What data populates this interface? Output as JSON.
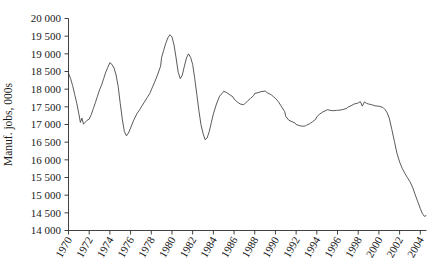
{
  "chart_data": {
    "type": "line",
    "title": "",
    "subtitle": "",
    "xlabel": "",
    "ylabel": "Manuf. jobs, 000s",
    "xlim": [
      1970.0,
      2004.6
    ],
    "ylim": [
      14000,
      20000
    ],
    "ytick_step": 500,
    "grid": false,
    "legend": false,
    "legend_position": "none",
    "line_color": "#3c3c3c",
    "ytick_labels": [
      "20 000",
      "19 500",
      "19 000",
      "18 500",
      "18 000",
      "17 500",
      "17 000",
      "16 500",
      "16 000",
      "15 500",
      "15 000",
      "14 500",
      "14 000"
    ],
    "ytick_values": [
      20000,
      19500,
      19000,
      18500,
      18000,
      17500,
      17000,
      16500,
      16000,
      15500,
      15000,
      14500,
      14000
    ],
    "xtick_labels": [
      "1970",
      "1972",
      "1974",
      "1976",
      "1978",
      "1980",
      "1982",
      "1984",
      "1986",
      "1988",
      "1990",
      "1992",
      "1994",
      "1996",
      "1998",
      "2000",
      "2002",
      "2004"
    ],
    "xtick_values": [
      1970,
      1972,
      1974,
      1976,
      1978,
      1980,
      1982,
      1984,
      1986,
      1988,
      1990,
      1992,
      1994,
      1996,
      1998,
      2000,
      2002,
      2004
    ],
    "series": [
      {
        "name": "Manufacturing jobs",
        "x": [
          1970.0,
          1970.2,
          1970.4,
          1970.6,
          1970.8,
          1971.0,
          1971.15,
          1971.3,
          1971.45,
          1971.6,
          1971.8,
          1972.0,
          1972.2,
          1972.4,
          1972.6,
          1972.8,
          1973.0,
          1973.2,
          1973.4,
          1973.6,
          1973.8,
          1974.0,
          1974.2,
          1974.4,
          1974.6,
          1974.8,
          1975.0,
          1975.2,
          1975.4,
          1975.6,
          1975.8,
          1976.0,
          1976.3,
          1976.6,
          1976.9,
          1977.0,
          1977.3,
          1977.6,
          1977.9,
          1978.0,
          1978.3,
          1978.6,
          1978.9,
          1979.0,
          1979.2,
          1979.4,
          1979.6,
          1979.8,
          1980.0,
          1980.2,
          1980.4,
          1980.6,
          1980.8,
          1981.0,
          1981.2,
          1981.4,
          1981.6,
          1981.8,
          1982.0,
          1982.2,
          1982.4,
          1982.6,
          1982.8,
          1983.0,
          1983.2,
          1983.4,
          1983.6,
          1983.8,
          1984.0,
          1984.3,
          1984.6,
          1984.9,
          1985.0,
          1985.3,
          1985.6,
          1985.9,
          1986.0,
          1986.3,
          1986.6,
          1986.9,
          1987.0,
          1987.3,
          1987.6,
          1987.9,
          1988.0,
          1988.3,
          1988.6,
          1988.9,
          1989.0,
          1989.2,
          1989.4,
          1989.6,
          1989.8,
          1990.0,
          1990.3,
          1990.6,
          1990.9,
          1991.0,
          1991.3,
          1991.6,
          1991.9,
          1992.0,
          1992.3,
          1992.6,
          1992.9,
          1993.0,
          1993.3,
          1993.6,
          1993.9,
          1994.0,
          1994.3,
          1994.6,
          1994.9,
          1995.0,
          1995.3,
          1995.6,
          1995.9,
          1996.0,
          1996.3,
          1996.6,
          1996.9,
          1997.0,
          1997.3,
          1997.6,
          1997.9,
          1998.0,
          1998.2,
          1998.4,
          1998.6,
          1998.8,
          1999.0,
          1999.3,
          1999.6,
          1999.9,
          2000.0,
          2000.2,
          2000.4,
          2000.6,
          2000.8,
          2001.0,
          2001.25,
          2001.5,
          2001.75,
          2002.0,
          2002.25,
          2002.5,
          2002.75,
          2003.0,
          2003.25,
          2003.5,
          2003.75,
          2004.0,
          2004.2,
          2004.4,
          2004.55
        ],
        "values": [
          18450,
          18300,
          18100,
          17850,
          17600,
          17300,
          17060,
          17180,
          17010,
          17060,
          17120,
          17150,
          17280,
          17450,
          17620,
          17800,
          17980,
          18120,
          18300,
          18480,
          18620,
          18750,
          18700,
          18600,
          18400,
          18080,
          17600,
          17150,
          16800,
          16680,
          16760,
          16900,
          17120,
          17300,
          17430,
          17480,
          17620,
          17760,
          17900,
          17980,
          18180,
          18400,
          18650,
          18900,
          19100,
          19300,
          19450,
          19540,
          19480,
          19250,
          18880,
          18480,
          18300,
          18400,
          18650,
          18880,
          19000,
          18900,
          18700,
          18300,
          17850,
          17400,
          17000,
          16750,
          16570,
          16620,
          16800,
          17050,
          17300,
          17580,
          17800,
          17900,
          17940,
          17900,
          17840,
          17780,
          17720,
          17640,
          17580,
          17560,
          17580,
          17660,
          17740,
          17820,
          17880,
          17900,
          17930,
          17940,
          17950,
          17900,
          17870,
          17840,
          17790,
          17740,
          17640,
          17500,
          17360,
          17230,
          17120,
          17080,
          17040,
          17000,
          16970,
          16950,
          16960,
          16980,
          17020,
          17080,
          17150,
          17220,
          17300,
          17360,
          17400,
          17420,
          17400,
          17390,
          17400,
          17400,
          17410,
          17430,
          17460,
          17490,
          17530,
          17580,
          17600,
          17610,
          17650,
          17520,
          17640,
          17600,
          17580,
          17560,
          17530,
          17520,
          17520,
          17500,
          17480,
          17420,
          17330,
          17180,
          16860,
          16520,
          16180,
          15940,
          15760,
          15620,
          15500,
          15380,
          15230,
          15020,
          14820,
          14620,
          14480,
          14400,
          14420
        ]
      }
    ],
    "annotations": [],
    "notes": {
      "peak_1979": 19540,
      "peak_1974": 18750,
      "peak_1981": 19000,
      "trough_1971": 17010,
      "trough_1975": 16680,
      "trough_1983": 16570,
      "trough_1992": 16950,
      "peak_1998": 17650,
      "end_2004": 14420
    }
  }
}
